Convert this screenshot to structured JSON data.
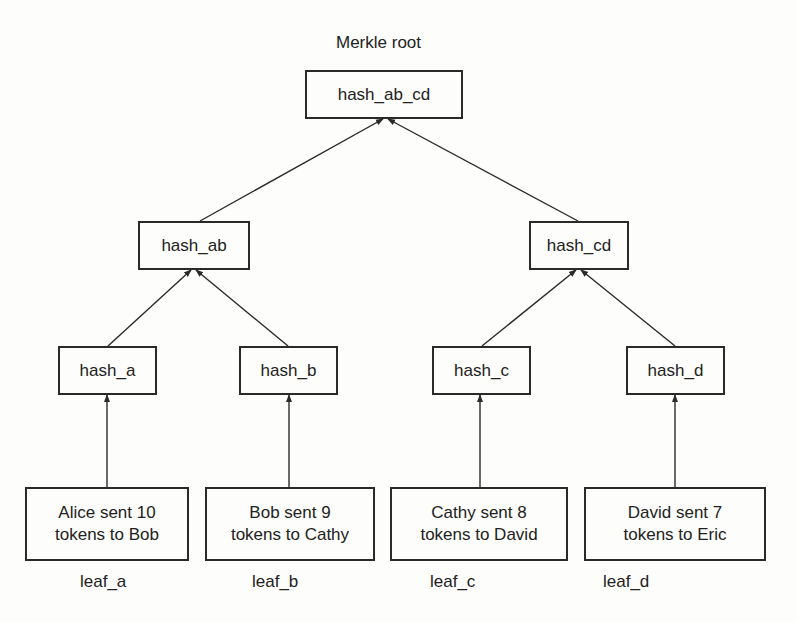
{
  "title": "Merkle root",
  "nodes": {
    "root": "hash_ab_cd",
    "hash_ab": "hash_ab",
    "hash_cd": "hash_cd",
    "hash_a": "hash_a",
    "hash_b": "hash_b",
    "hash_c": "hash_c",
    "hash_d": "hash_d"
  },
  "leaves": [
    {
      "line1": "Alice sent 10",
      "line2": "tokens to Bob",
      "label": "leaf_a"
    },
    {
      "line1": "Bob sent 9",
      "line2": "tokens to Cathy",
      "label": "leaf_b"
    },
    {
      "line1": "Cathy sent 8",
      "line2": "tokens to David",
      "label": "leaf_c"
    },
    {
      "line1": "David sent 7",
      "line2": "tokens to Eric",
      "label": "leaf_d"
    }
  ],
  "colors": {
    "line": "#2a2a2a",
    "background": "#fdfdfb"
  }
}
